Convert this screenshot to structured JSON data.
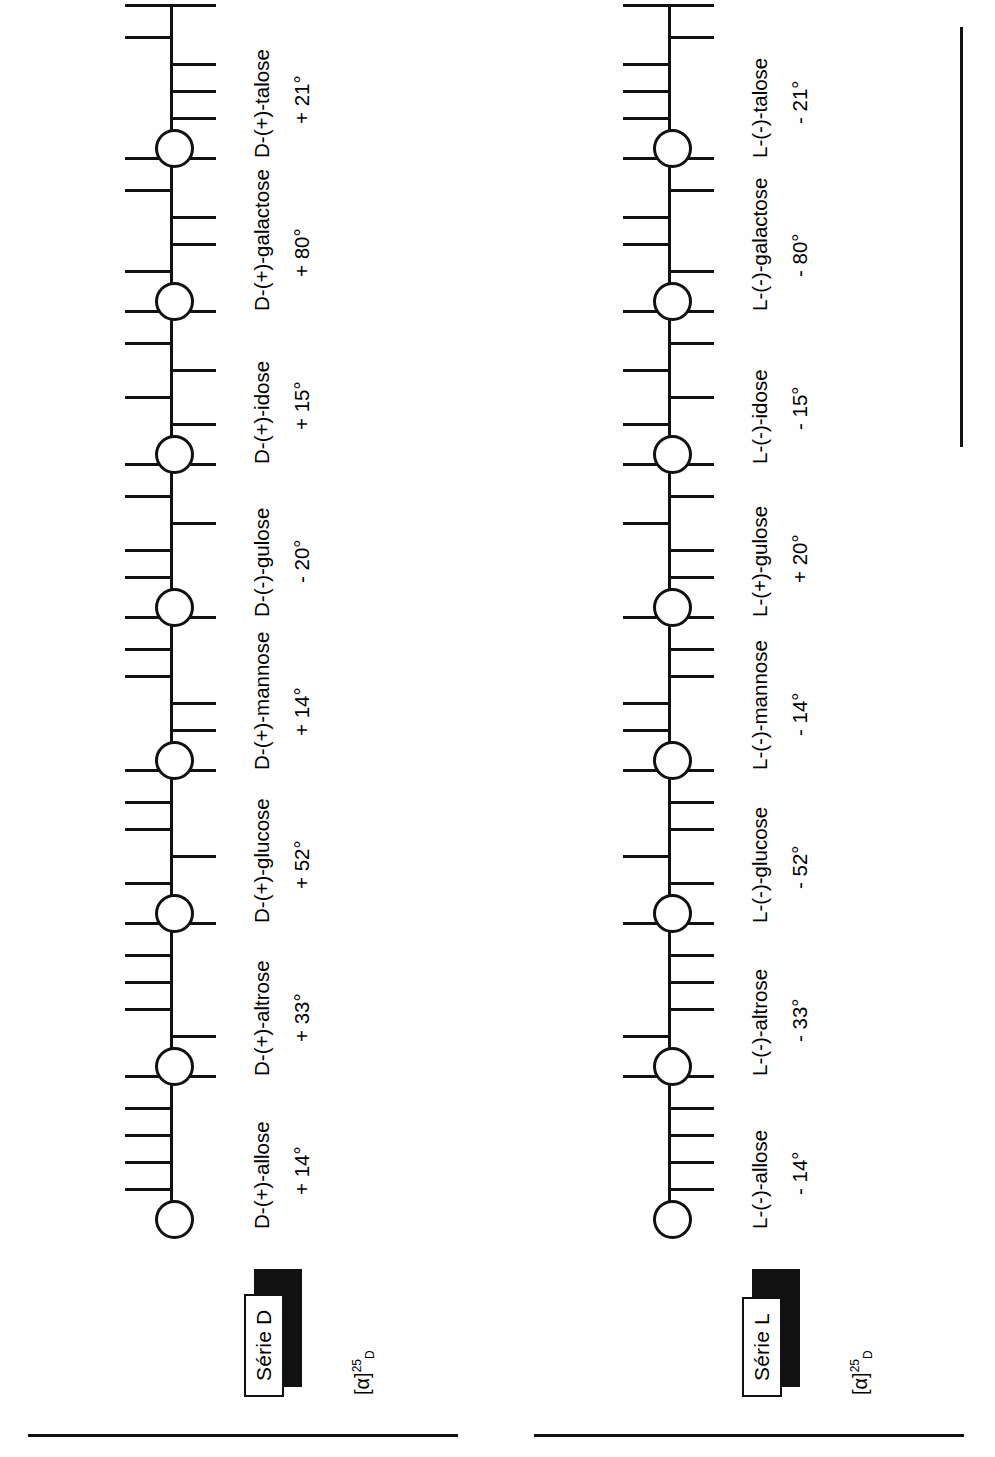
{
  "figure": {
    "type": "chemical-structure-chart",
    "orientation": "rotated-90-ccw"
  },
  "series": [
    {
      "id": "d",
      "badge": "Série D",
      "alpha_label": "[α]",
      "alpha_sup": "25",
      "alpha_sub": "D",
      "sugars": [
        {
          "name": "D-(+)-allose",
          "rotation": "+ 14°",
          "oh": [
            "up",
            "up",
            "up",
            "up"
          ]
        },
        {
          "name": "D-(+)-altrose",
          "rotation": "+ 33°",
          "oh": [
            "down",
            "up",
            "up",
            "up"
          ]
        },
        {
          "name": "D-(+)-glucose",
          "rotation": "+ 52°",
          "oh": [
            "up",
            "down",
            "up",
            "up"
          ]
        },
        {
          "name": "D-(+)-mannose",
          "rotation": "+ 14°",
          "oh": [
            "down",
            "down",
            "up",
            "up"
          ]
        },
        {
          "name": "D-(-)-gulose",
          "rotation": "- 20°",
          "oh": [
            "up",
            "up",
            "down",
            "up"
          ]
        },
        {
          "name": "D-(+)-idose",
          "rotation": "+ 15°",
          "oh": [
            "down",
            "up",
            "down",
            "up"
          ]
        },
        {
          "name": "D-(+)-galactose",
          "rotation": "+ 80°",
          "oh": [
            "up",
            "down",
            "down",
            "up"
          ]
        },
        {
          "name": "D-(+)-talose",
          "rotation": "+ 21°",
          "oh": [
            "down",
            "down",
            "down",
            "up"
          ]
        }
      ]
    },
    {
      "id": "l",
      "badge": "Série L",
      "alpha_label": "[α]",
      "alpha_sup": "25",
      "alpha_sub": "D",
      "sugars": [
        {
          "name": "L-(-)-allose",
          "rotation": "- 14°",
          "oh": [
            "down",
            "down",
            "down",
            "down"
          ]
        },
        {
          "name": "L-(-)-altrose",
          "rotation": "- 33°",
          "oh": [
            "up",
            "down",
            "down",
            "down"
          ]
        },
        {
          "name": "L-(-)-glucose",
          "rotation": "- 52°",
          "oh": [
            "down",
            "up",
            "down",
            "down"
          ]
        },
        {
          "name": "L-(-)-mannose",
          "rotation": "- 14°",
          "oh": [
            "up",
            "up",
            "down",
            "down"
          ]
        },
        {
          "name": "L-(+)-gulose",
          "rotation": "+ 20°",
          "oh": [
            "down",
            "down",
            "up",
            "down"
          ]
        },
        {
          "name": "L-(-)-idose",
          "rotation": "- 15°",
          "oh": [
            "up",
            "down",
            "up",
            "down"
          ]
        },
        {
          "name": "L-(-)-galactose",
          "rotation": "- 80°",
          "oh": [
            "down",
            "up",
            "up",
            "down"
          ]
        },
        {
          "name": "L-(-)-talose",
          "rotation": "- 21°",
          "oh": [
            "up",
            "up",
            "up",
            "down"
          ]
        }
      ]
    }
  ],
  "colors": {
    "ink": "#111111",
    "paper": "#ffffff"
  }
}
